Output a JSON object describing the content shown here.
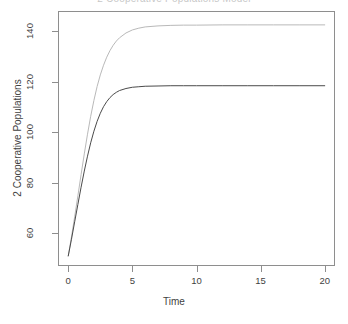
{
  "chart_data": {
    "type": "line",
    "title": "2 Cooperative Populations Model",
    "xlabel": "Time",
    "ylabel": "2 Cooperative Populations",
    "xlim": [
      -0.8,
      20.8
    ],
    "ylim": [
      47,
      148
    ],
    "xticks": [
      0,
      5,
      10,
      15,
      20
    ],
    "xtick_labels": [
      "0",
      "5",
      "10",
      "15",
      "20"
    ],
    "yticks": [
      60,
      80,
      100,
      120,
      140
    ],
    "ytick_labels": [
      "60",
      "80",
      "100",
      "120",
      "140"
    ],
    "grid": false,
    "legend": false,
    "legend_position": "none",
    "x": [
      0,
      0.25,
      0.5,
      0.75,
      1,
      1.25,
      1.5,
      1.75,
      2,
      2.25,
      2.5,
      2.75,
      3,
      3.25,
      3.5,
      3.75,
      4,
      4.5,
      5,
      5.5,
      6,
      7,
      8,
      9,
      10,
      12,
      14,
      16,
      18,
      20
    ],
    "series": [
      {
        "name": "Population 1",
        "color": "#b9b9b9",
        "values": [
          51,
          58.5,
          66.5,
          74.8,
          83.2,
          91.4,
          99.2,
          106.3,
          112.6,
          118.1,
          122.7,
          126.5,
          129.7,
          132.3,
          134.4,
          136.1,
          137.4,
          139.3,
          140.5,
          141.2,
          141.7,
          142.1,
          142.3,
          142.4,
          142.4,
          142.5,
          142.5,
          142.5,
          142.5,
          142.5
        ]
      },
      {
        "name": "Population 2",
        "color": "#4a4a4a",
        "values": [
          51,
          57.6,
          64.5,
          71.4,
          78.2,
          84.6,
          90.5,
          95.8,
          100.4,
          104.3,
          107.5,
          110.1,
          112.1,
          113.7,
          114.9,
          115.8,
          116.5,
          117.3,
          117.8,
          118.0,
          118.2,
          118.3,
          118.4,
          118.4,
          118.4,
          118.4,
          118.4,
          118.4,
          118.4,
          118.4
        ]
      }
    ]
  }
}
